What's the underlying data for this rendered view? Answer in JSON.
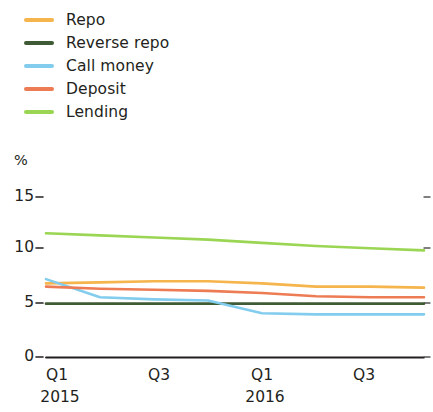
{
  "legend": {
    "position": "top-left",
    "items": [
      {
        "label": "Repo",
        "color": "#f5b44c"
      },
      {
        "label": "Reverse repo",
        "color": "#3f5b36"
      },
      {
        "label": "Call money",
        "color": "#82cced"
      },
      {
        "label": "Deposit",
        "color": "#ed7b53"
      },
      {
        "label": "Lending",
        "color": "#9ad653"
      }
    ]
  },
  "axes": {
    "unit": "%",
    "y_ticks": [
      "0",
      "5",
      "10",
      "15"
    ],
    "x_ticks": [
      "Q1",
      "Q3",
      "Q1",
      "Q3"
    ],
    "x_years": [
      "2015",
      "2016"
    ]
  },
  "chart_data": {
    "type": "line",
    "title": "",
    "xlabel": "",
    "ylabel": "%",
    "ylim": [
      0,
      15
    ],
    "yticks": [
      0,
      5,
      10,
      15
    ],
    "grid": false,
    "legend_position": "top-left",
    "x": [
      "2015 Q1",
      "2015 Q2",
      "2015 Q3",
      "2015 Q4",
      "2016 Q1",
      "2016 Q2",
      "2016 Q3",
      "2016 Q4"
    ],
    "xticklabels": [
      "Q1",
      "",
      "Q3",
      "",
      "Q1",
      "",
      "Q3",
      ""
    ],
    "series": [
      {
        "name": "Repo",
        "color": "#f5b44c",
        "values": [
          6.9,
          7.0,
          7.1,
          7.1,
          6.9,
          6.6,
          6.6,
          6.5
        ]
      },
      {
        "name": "Reverse repo",
        "color": "#3f5b36",
        "values": [
          5.0,
          5.0,
          5.0,
          5.0,
          5.0,
          5.0,
          5.0,
          5.0
        ]
      },
      {
        "name": "Call money",
        "color": "#82cced",
        "values": [
          7.3,
          5.6,
          5.4,
          5.3,
          4.1,
          4.0,
          4.0,
          4.0
        ]
      },
      {
        "name": "Deposit",
        "color": "#ed7b53",
        "values": [
          6.6,
          6.4,
          6.3,
          6.2,
          6.0,
          5.7,
          5.6,
          5.6
        ]
      },
      {
        "name": "Lending",
        "color": "#9ad653",
        "values": [
          11.6,
          11.4,
          11.2,
          11.0,
          10.7,
          10.4,
          10.2,
          10.0
        ]
      }
    ]
  }
}
